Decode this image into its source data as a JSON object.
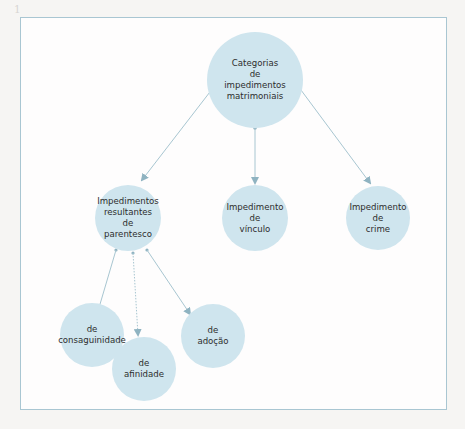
{
  "diagram": {
    "type": "concept-map",
    "colors": {
      "node_fill": "#cfe5ee",
      "edge": "#8fb3c1",
      "frame_border": "#a9c6d2",
      "text": "#2d2d2d"
    },
    "root": {
      "id": "root",
      "lines": [
        "Categorias",
        "de",
        "impedimentos",
        "matrimoniais"
      ]
    },
    "level1": [
      {
        "id": "parentesco",
        "lines": [
          "Impedimentos",
          "resultantes",
          "de",
          "parentesco"
        ]
      },
      {
        "id": "vinculo",
        "lines": [
          "Impedimento",
          "de",
          "vínculo"
        ]
      },
      {
        "id": "crime",
        "lines": [
          "Impedimento",
          "de",
          "crime"
        ]
      }
    ],
    "level2": [
      {
        "id": "consaguinidade",
        "parent": "parentesco",
        "lines": [
          "de",
          "consaguinidade"
        ]
      },
      {
        "id": "afinidade",
        "parent": "parentesco",
        "lines": [
          "de",
          "afinidade"
        ],
        "edge_style": "dotted"
      },
      {
        "id": "adocao",
        "parent": "parentesco",
        "lines": [
          "de",
          "adoção"
        ]
      }
    ],
    "edges": [
      {
        "from": "root",
        "to": "parentesco",
        "style": "solid"
      },
      {
        "from": "root",
        "to": "vinculo",
        "style": "solid"
      },
      {
        "from": "root",
        "to": "crime",
        "style": "solid"
      },
      {
        "from": "parentesco",
        "to": "consaguinidade",
        "style": "solid"
      },
      {
        "from": "parentesco",
        "to": "afinidade",
        "style": "dotted"
      },
      {
        "from": "parentesco",
        "to": "adocao",
        "style": "solid"
      }
    ]
  }
}
